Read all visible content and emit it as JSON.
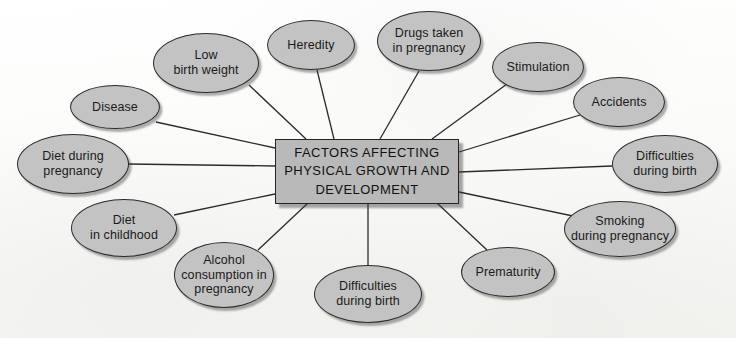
{
  "diagram": {
    "type": "spider-web-mind-map",
    "canvas": {
      "width": 736,
      "height": 338
    },
    "colors": {
      "background": "#fbfbf9",
      "ellipse_fill": "#c3c3c3",
      "center_fill": "#b9b9b9",
      "stroke": "#2b2b2b",
      "text": "#1a1a1a"
    },
    "center": {
      "label": "FACTORS AFFECTING PHYSICAL GROWTH AND DEVELOPMENT",
      "line1": "FACTORS AFFECTING",
      "line2": "PHYSICAL GROWTH AND",
      "line3": "DEVELOPMENT",
      "x": 275,
      "y": 139,
      "w": 184,
      "h": 65
    },
    "nodes": [
      {
        "id": "low-birth-weight",
        "label": "Low birth weight",
        "line1": "Low",
        "line2": "birth weight",
        "cx": 206,
        "cy": 63,
        "rx": 53,
        "ry": 30
      },
      {
        "id": "heredity",
        "label": "Heredity",
        "line1": "Heredity",
        "line2": "",
        "cx": 311,
        "cy": 45,
        "rx": 44,
        "ry": 25
      },
      {
        "id": "drugs-taken-pregnancy",
        "label": "Drugs taken in pregnancy",
        "line1": "Drugs taken",
        "line2": "in pregnancy",
        "cx": 429,
        "cy": 41,
        "rx": 52,
        "ry": 30
      },
      {
        "id": "stimulation",
        "label": "Stimulation",
        "line1": "Stimulation",
        "line2": "",
        "cx": 538,
        "cy": 67,
        "rx": 46,
        "ry": 25
      },
      {
        "id": "accidents",
        "label": "Accidents",
        "line1": "Accidents",
        "line2": "",
        "cx": 619,
        "cy": 102,
        "rx": 46,
        "ry": 25
      },
      {
        "id": "difficulties-birth-r",
        "label": "Difficulties during birth",
        "line1": "Difficulties",
        "line2": "during birth",
        "cx": 665,
        "cy": 164,
        "rx": 53,
        "ry": 29
      },
      {
        "id": "smoking-pregnancy",
        "label": "Smoking during pregnancy",
        "line1": "Smoking",
        "line2": "during pregnancy",
        "cx": 620,
        "cy": 229,
        "rx": 56,
        "ry": 28
      },
      {
        "id": "prematurity",
        "label": "Prematurity",
        "line1": "Prematurity",
        "line2": "",
        "cx": 508,
        "cy": 272,
        "rx": 47,
        "ry": 25
      },
      {
        "id": "difficulties-birth-b",
        "label": "Difficulties during birth",
        "line1": "Difficulties",
        "line2": "during birth",
        "cx": 368,
        "cy": 294,
        "rx": 54,
        "ry": 29
      },
      {
        "id": "alcohol-pregnancy",
        "label": "Alcohol consumption in pregnancy",
        "line1": "Alcohol",
        "line2": "consumption in",
        "line3": "pregnancy",
        "cx": 224,
        "cy": 275,
        "rx": 50,
        "ry": 33
      },
      {
        "id": "diet-childhood",
        "label": "Diet in childhood",
        "line1": "Diet",
        "line2": "in childhood",
        "cx": 124,
        "cy": 228,
        "rx": 53,
        "ry": 29
      },
      {
        "id": "diet-pregnancy",
        "label": "Diet during pregnancy",
        "line1": "Diet during",
        "line2": "pregnancy",
        "cx": 73,
        "cy": 164,
        "rx": 56,
        "ry": 30
      },
      {
        "id": "disease",
        "label": "Disease",
        "line1": "Disease",
        "line2": "",
        "cx": 115,
        "cy": 107,
        "rx": 45,
        "ry": 22
      }
    ],
    "edges": [
      {
        "from": "center",
        "to": "low-birth-weight",
        "x1": 306,
        "y1": 139,
        "x2": 249,
        "y2": 85
      },
      {
        "from": "center",
        "to": "heredity",
        "x1": 334,
        "y1": 139,
        "x2": 317,
        "y2": 70
      },
      {
        "from": "center",
        "to": "drugs-taken-pregnancy",
        "x1": 380,
        "y1": 139,
        "x2": 419,
        "y2": 71
      },
      {
        "from": "center",
        "to": "stimulation",
        "x1": 432,
        "y1": 139,
        "x2": 507,
        "y2": 84
      },
      {
        "from": "center",
        "to": "accidents",
        "x1": 459,
        "y1": 152,
        "x2": 580,
        "y2": 115
      },
      {
        "from": "center",
        "to": "difficulties-birth-r",
        "x1": 459,
        "y1": 172,
        "x2": 612,
        "y2": 166
      },
      {
        "from": "center",
        "to": "smoking-pregnancy",
        "x1": 459,
        "y1": 192,
        "x2": 573,
        "y2": 216
      },
      {
        "from": "center",
        "to": "prematurity",
        "x1": 437,
        "y1": 203,
        "x2": 487,
        "y2": 250
      },
      {
        "from": "center",
        "to": "difficulties-birth-b",
        "x1": 368,
        "y1": 203,
        "x2": 368,
        "y2": 266
      },
      {
        "from": "center",
        "to": "alcohol-pregnancy",
        "x1": 308,
        "y1": 203,
        "x2": 258,
        "y2": 250
      },
      {
        "from": "center",
        "to": "diet-childhood",
        "x1": 275,
        "y1": 194,
        "x2": 174,
        "y2": 215
      },
      {
        "from": "center",
        "to": "diet-pregnancy",
        "x1": 275,
        "y1": 166,
        "x2": 128,
        "y2": 164
      },
      {
        "from": "center",
        "to": "disease",
        "x1": 275,
        "y1": 148,
        "x2": 156,
        "y2": 122
      }
    ]
  }
}
